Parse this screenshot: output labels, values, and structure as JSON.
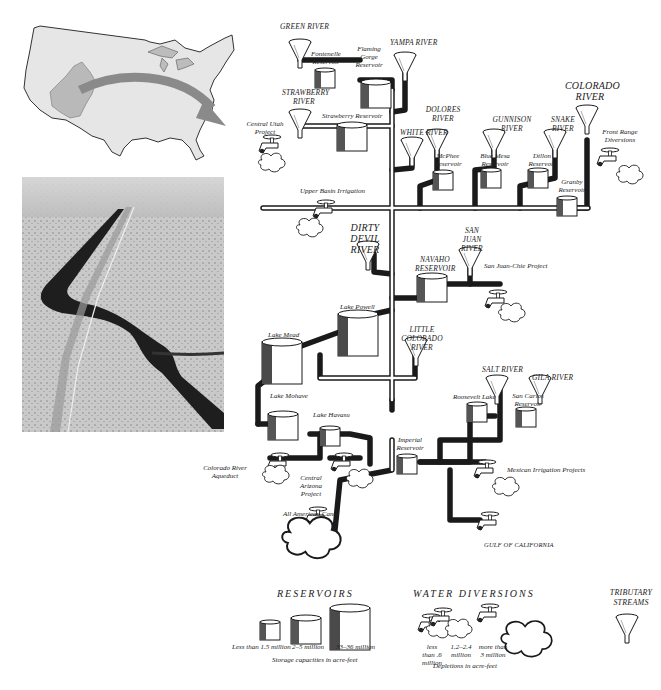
{
  "figure": {
    "type": "infographic-diagram"
  },
  "inset_map": {
    "name": "United States map",
    "highlight": "Colorado River basin",
    "arrow": "points from basin to diagram"
  },
  "photo": {
    "name": "Aerial photo of canal in desert"
  },
  "tributaries": [
    {
      "id": "green",
      "label": "GREEN RIVER"
    },
    {
      "id": "yampa",
      "label": "YAMPA RIVER"
    },
    {
      "id": "strawberry",
      "label": "STRAWBERRY RIVER"
    },
    {
      "id": "white",
      "label": "WHITE RIVER"
    },
    {
      "id": "dolores",
      "label": "DOLORES RIVER"
    },
    {
      "id": "gunnison",
      "label": "GUNNISON RIVER"
    },
    {
      "id": "snake",
      "label": "SNAKE RIVER"
    },
    {
      "id": "colorado",
      "label": "COLORADO RIVER"
    },
    {
      "id": "dirty_devil",
      "label": "DIRTY DEVIL RIVER"
    },
    {
      "id": "san_juan",
      "label": "SAN JUAN RIVER"
    },
    {
      "id": "little_colorado",
      "label": "LITTLE COLORADO RIVER"
    },
    {
      "id": "salt",
      "label": "SALT RIVER"
    },
    {
      "id": "gila",
      "label": "GILA RIVER"
    }
  ],
  "reservoirs": [
    {
      "id": "fontenelle",
      "label": "Fontenelle Reservoir"
    },
    {
      "id": "flaming_gorge",
      "label": "Flaming Gorge Reservoir"
    },
    {
      "id": "strawberry_res",
      "label": "Strawberry Reservoir"
    },
    {
      "id": "mcphee",
      "label": "McPhee Reservoir"
    },
    {
      "id": "blue_mesa",
      "label": "Blue Mesa Reservoir"
    },
    {
      "id": "dillon",
      "label": "Dillon Reservoir"
    },
    {
      "id": "granby",
      "label": "Granby Reservoir"
    },
    {
      "id": "navaho",
      "label": "NAVAHO RESERVOIR"
    },
    {
      "id": "powell",
      "label": "Lake Powell"
    },
    {
      "id": "mead",
      "label": "Lake Mead"
    },
    {
      "id": "mohave",
      "label": "Lake Mohave"
    },
    {
      "id": "havasu",
      "label": "Lake Havasu"
    },
    {
      "id": "imperial",
      "label": "Imperial Reservoir"
    },
    {
      "id": "roosevelt",
      "label": "Roosevelt Lake"
    },
    {
      "id": "san_carlos",
      "label": "San Carlos Reservoir"
    }
  ],
  "diversions": [
    {
      "id": "central_utah",
      "label": "Central Utah Project"
    },
    {
      "id": "front_range",
      "label": "Front Range Diversions"
    },
    {
      "id": "upper_basin",
      "label": "Upper Basin Irrigation"
    },
    {
      "id": "san_juan_chama",
      "label": "San Juan-Chie Project"
    },
    {
      "id": "co_aqueduct",
      "label": "Colorado River Aqueduct"
    },
    {
      "id": "central_az",
      "label": "Central Arizona Project"
    },
    {
      "id": "mexican",
      "label": "Mexican Irrigation Projects"
    },
    {
      "id": "all_american",
      "label": "All American Canal"
    }
  ],
  "outlet": {
    "label": "GULF OF CALIFORNIA"
  },
  "legend": {
    "reservoirs": {
      "title": "RESERVOIRS",
      "sizes": [
        "Less than 1.5 million",
        "2–5 million",
        "33–36 million"
      ],
      "caption": "Storage capacities in acre-feet"
    },
    "diversions": {
      "title": "WATER DIVERSIONS",
      "sizes": [
        "less than .6 million",
        "1.2–2.4 million",
        "more than 3 million"
      ],
      "caption": "Depletions in acre-feet"
    },
    "tributary": {
      "title": "TRIBUTARY STREAMS"
    }
  },
  "colors": {
    "ink": "#1a1a1a",
    "map_fill": "#e6e6e6",
    "basin_fill": "#b9b9b9",
    "arrow": "#8a8a8a",
    "paper": "#ffffff"
  }
}
